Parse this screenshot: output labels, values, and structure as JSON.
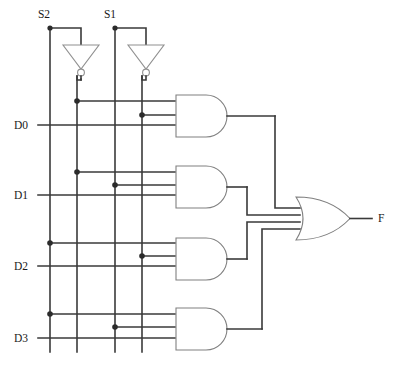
{
  "diagram": {
    "labels": {
      "select_1": "S2",
      "select_0": "S1",
      "data_0": "D0",
      "data_1": "D1",
      "data_2": "D2",
      "data_3": "D3",
      "output": "F"
    },
    "colors": {
      "wire": "#3a3a3a",
      "gate_outline": "#808080",
      "junction": "#2b2b2b",
      "background": "#ffffff",
      "text": "#1a1a1a"
    },
    "signals": {
      "select_lines": [
        "S2",
        "S1"
      ],
      "data_lines": [
        "D0",
        "D1",
        "D2",
        "D3"
      ],
      "output_line": "F"
    },
    "gates": {
      "inverters": [
        {
          "name": "inverter-s2",
          "input": "S2",
          "output": "S2'"
        },
        {
          "name": "inverter-s1",
          "input": "S1",
          "output": "S1'"
        }
      ],
      "and_gates": [
        {
          "name": "and-gate-1",
          "inputs": [
            "S2'",
            "S1'",
            "D0"
          ]
        },
        {
          "name": "and-gate-2",
          "inputs": [
            "S2'",
            "S1",
            "D1"
          ]
        },
        {
          "name": "and-gate-3",
          "inputs": [
            "S2",
            "S1'",
            "D2"
          ]
        },
        {
          "name": "and-gate-4",
          "inputs": [
            "S2",
            "S1",
            "D3"
          ]
        }
      ],
      "or_gate": {
        "name": "or-gate-output",
        "input_count": 4,
        "output": "F"
      }
    },
    "vertical_bus_x": [
      50,
      77,
      115,
      142
    ],
    "bus_meaning": [
      "S2",
      "S2'",
      "S1",
      "S1'"
    ]
  }
}
